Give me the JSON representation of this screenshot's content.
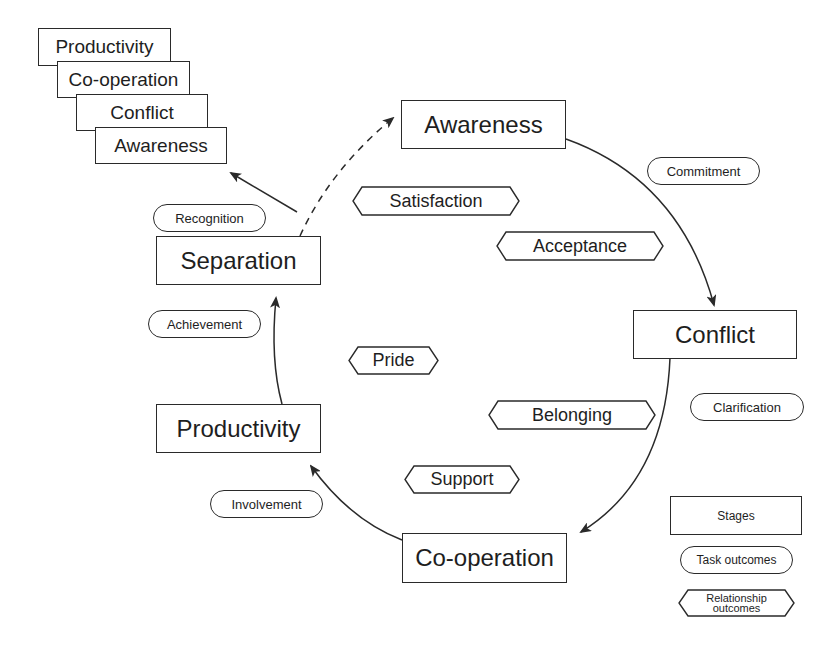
{
  "diagram": {
    "stack": [
      "Productivity",
      "Co-operation",
      "Conflict",
      "Awareness"
    ],
    "stages": {
      "awareness": "Awareness",
      "conflict": "Conflict",
      "cooperation": "Co-operation",
      "productivity": "Productivity",
      "separation": "Separation"
    },
    "task_outcomes": {
      "commitment": "Commitment",
      "clarification": "Clarification",
      "involvement": "Involvement",
      "achievement": "Achievement",
      "recognition": "Recognition"
    },
    "relationship_outcomes": {
      "satisfaction": "Satisfaction",
      "acceptance": "Acceptance",
      "belonging": "Belonging",
      "support": "Support",
      "pride": "Pride"
    },
    "legend": {
      "stages": "Stages",
      "task_outcomes": "Task outcomes",
      "relationship_outcomes": "Relationship outcomes"
    },
    "colors": {
      "line": "#2a2a2a",
      "background": "#ffffff",
      "text": "#1e1e1e"
    }
  }
}
